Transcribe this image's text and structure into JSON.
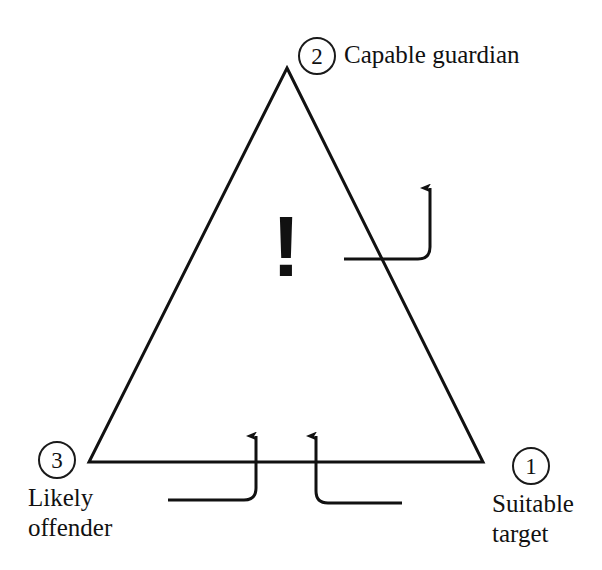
{
  "figure": {
    "type": "crime-triangle-diagram",
    "background_color": "#ffffff",
    "stroke_color": "#111111",
    "canvas": {
      "width": 602,
      "height": 570
    }
  },
  "shape": {
    "name": "triangle",
    "apex": {
      "x": 287,
      "y": 68
    },
    "bottom_left": {
      "x": 89,
      "y": 462
    },
    "bottom_right": {
      "x": 483,
      "y": 462
    },
    "stroke_width": 3
  },
  "center_symbol": {
    "glyph": "!",
    "meaning": "warning-exclamation"
  },
  "vertices": [
    {
      "id": "capable-guardian",
      "number": "2",
      "label": "Capable guardian",
      "position": "apex"
    },
    {
      "id": "suitable-target",
      "number": "1",
      "label": "Suitable\ntarget",
      "position": "bottom-right"
    },
    {
      "id": "likely-offender",
      "number": "3",
      "label": "Likely\noffender",
      "position": "bottom-left"
    }
  ],
  "arrows": [
    {
      "id": "guardian-edge-arrow",
      "description": "elbow arrow crossing the right edge of the triangle, pointing up",
      "tail_x": 344,
      "tail_y": 259,
      "elbow_x": 430,
      "tip_y": 176
    },
    {
      "id": "left-base-arrow",
      "description": "elbow arrow from lower-left crossing the base, pointing up",
      "tail_x": 168,
      "tail_y": 500,
      "elbow_x": 256,
      "tip_y": 424
    },
    {
      "id": "right-base-arrow",
      "description": "elbow arrow from lower-right crossing the base, pointing up",
      "tail_x": 402,
      "tail_y": 503,
      "elbow_x": 316,
      "tip_y": 424
    }
  ]
}
